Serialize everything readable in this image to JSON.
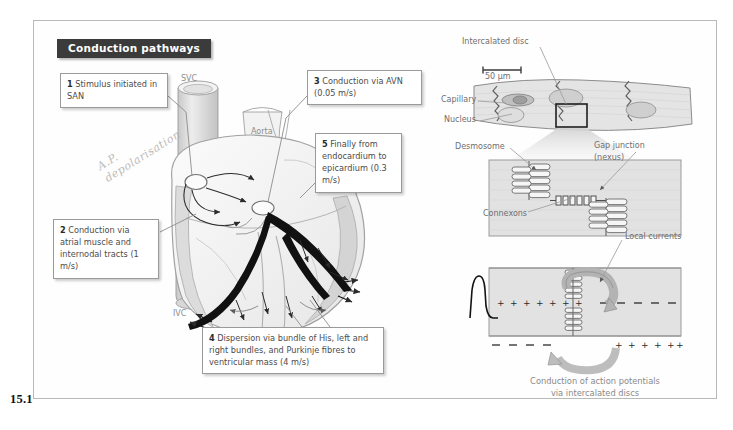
{
  "figure": {
    "number": "15.1",
    "title": "Conduction pathways"
  },
  "callouts": [
    {
      "num": "1",
      "text": "Stimulus initiated in SAN"
    },
    {
      "num": "2",
      "text": "Conduction via atrial muscle and internodal tracts (1 m/s)"
    },
    {
      "num": "3",
      "text": "Conduction via AVN (0.05 m/s)"
    },
    {
      "num": "4",
      "text": "Dispersion via bundle of His, left and right bundles, and Purkinje fibres to ventricular mass (4 m/s)"
    },
    {
      "num": "5",
      "text": "Finally from endocardium to epicardium (0.3 m/s)"
    }
  ],
  "heart_labels": {
    "svc": "SVC",
    "aorta": "Aorta",
    "ivc": "IVC"
  },
  "pencil_annotation": "A.P. depolarisation",
  "cell_labels": {
    "intercalated_disc": "Intercalated disc",
    "capillary": "Capillary",
    "nucleus": "Nucleus",
    "scale_bar": "50 µm",
    "desmosome": "Desmosome",
    "gap_junction_line1": "Gap junction",
    "gap_junction_line2": "(nexus)",
    "connexons": "Connexons",
    "local_currents": "Local currents"
  },
  "bottom_caption": {
    "line1": "Conduction of action potentials",
    "line2": "via intercalated discs"
  },
  "colors": {
    "banner_bg": "#3b3b3b",
    "banner_text": "#ffffff",
    "callout_text": "#4c4c4c",
    "label_grey": "#8d8d8d",
    "tissue_grey": "#d8d8d8",
    "dark_pathway": "#111111",
    "page_border": "#b9b9b9"
  }
}
